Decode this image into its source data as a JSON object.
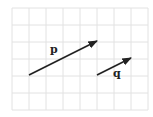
{
  "diagram": {
    "grid": {
      "x0": 12,
      "y0": 8,
      "cell": 17,
      "cols": 8,
      "rows": 6,
      "color": "#e2e2e2"
    },
    "vectors": [
      {
        "name": "p",
        "label": "p",
        "from": [
          29,
          75
        ],
        "to": [
          97,
          41
        ],
        "label_pos": [
          50,
          44
        ],
        "color": "#222222"
      },
      {
        "name": "q",
        "label": "q",
        "from": [
          97,
          75
        ],
        "to": [
          131,
          58
        ],
        "label_pos": [
          113,
          68
        ],
        "color": "#222222"
      }
    ]
  }
}
